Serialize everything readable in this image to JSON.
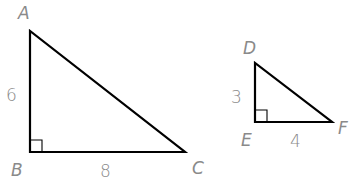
{
  "diagram": {
    "triangles": [
      {
        "name": "ABC",
        "vertices": {
          "A": "A",
          "B": "B",
          "C": "C"
        },
        "right_angle_at": "B",
        "sides": {
          "AB": "6",
          "BC": "8"
        }
      },
      {
        "name": "DEF",
        "vertices": {
          "D": "D",
          "E": "E",
          "F": "F"
        },
        "right_angle_at": "E",
        "sides": {
          "DE": "3",
          "EF": "4"
        }
      }
    ],
    "colors": {
      "stroke": "#000000",
      "label": "#8a8a8a"
    }
  }
}
